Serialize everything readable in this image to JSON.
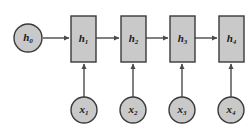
{
  "figure": {
    "kind": "rnn-unrolled-computational-graph",
    "background_color": "#ffffff",
    "node_fill": "#c9c9c9",
    "node_stroke": "#3a3a3a",
    "arrow_color": "#4a4a4a"
  },
  "initial_state": {
    "id": "h0",
    "shape": "circle",
    "base": "h",
    "subscript": "0",
    "cx": 28,
    "cy": 38,
    "r": 14
  },
  "hidden_states": [
    {
      "id": "h1",
      "shape": "rect",
      "base": "h",
      "subscript": "1",
      "x": 71,
      "y": 16,
      "w": 25,
      "h": 46
    },
    {
      "id": "h2",
      "shape": "rect",
      "base": "h",
      "subscript": "2",
      "x": 121,
      "y": 16,
      "w": 25,
      "h": 46
    },
    {
      "id": "h3",
      "shape": "rect",
      "base": "h",
      "subscript": "3",
      "x": 170,
      "y": 16,
      "w": 25,
      "h": 46
    },
    {
      "id": "h4",
      "shape": "rect",
      "base": "h",
      "subscript": "4",
      "x": 219,
      "y": 16,
      "w": 25,
      "h": 46
    }
  ],
  "inputs": [
    {
      "id": "x1",
      "shape": "circle",
      "base": "x",
      "subscript": "1",
      "cx": 84,
      "cy": 110,
      "r": 13
    },
    {
      "id": "x2",
      "shape": "circle",
      "base": "x",
      "subscript": "2",
      "cx": 133,
      "cy": 110,
      "r": 13
    },
    {
      "id": "x3",
      "shape": "circle",
      "base": "x",
      "subscript": "3",
      "cx": 182,
      "cy": 110,
      "r": 13
    },
    {
      "id": "x4",
      "shape": "circle",
      "base": "x",
      "subscript": "4",
      "cx": 231,
      "cy": 110,
      "r": 13
    }
  ],
  "recurrent_edges": [
    {
      "id": "h0-h1",
      "from": "h0",
      "to": "h1",
      "x1": 43,
      "y1": 38,
      "x2": 69,
      "y2": 38
    },
    {
      "id": "h1-h2",
      "from": "h1",
      "to": "h2",
      "x1": 96,
      "y1": 38,
      "x2": 119,
      "y2": 38
    },
    {
      "id": "h2-h3",
      "from": "h2",
      "to": "h3",
      "x1": 146,
      "y1": 38,
      "x2": 168,
      "y2": 38
    },
    {
      "id": "h3-h4",
      "from": "h3",
      "to": "h4",
      "x1": 195,
      "y1": 38,
      "x2": 217,
      "y2": 38
    }
  ],
  "input_edges": [
    {
      "id": "x1-h1",
      "from": "x1",
      "to": "h1",
      "x1": 84,
      "y1": 97,
      "x2": 84,
      "y2": 64
    },
    {
      "id": "x2-h2",
      "from": "x2",
      "to": "h2",
      "x1": 133,
      "y1": 97,
      "x2": 133,
      "y2": 64
    },
    {
      "id": "x3-h3",
      "from": "x3",
      "to": "h3",
      "x1": 182,
      "y1": 97,
      "x2": 182,
      "y2": 64
    },
    {
      "id": "x4-h4",
      "from": "x4",
      "to": "h4",
      "x1": 231,
      "y1": 97,
      "x2": 231,
      "y2": 64
    }
  ]
}
